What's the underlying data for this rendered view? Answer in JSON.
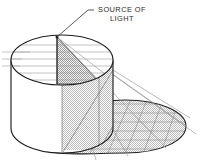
{
  "figure": {
    "label": {
      "line1": "SOURCE OF",
      "line2": "LIGHT",
      "full_text": "SOURCE OF LIGHT",
      "leader_line": "leader-line-to-source-point"
    },
    "colors": {
      "background": "#ffffff",
      "outline": "#1f1f1f",
      "construction_line": "#9a9a9a",
      "ray_line": "#8d8d8d",
      "stipple_fill": "#d9d9d9",
      "text": "#2b2b2b"
    },
    "parts": [
      {
        "name": "cylinder-top-ellipse",
        "description": "Top circular face of the cylinder seen in oblique projection"
      },
      {
        "name": "cylinder-body",
        "description": "Vertical side wall of the cylinder"
      },
      {
        "name": "cylinder-base-ellipse",
        "description": "Bottom circular face of the cylinder"
      },
      {
        "name": "light-source-point",
        "description": "Point source located above the top face"
      },
      {
        "name": "light-source-post",
        "description": "Vertical line dropping from the source to the top face"
      },
      {
        "name": "lit-top-sector",
        "description": "Stippled triangular sector of the top face reached by light"
      },
      {
        "name": "cylinder-shaded-side",
        "description": "Stippled portion of the cylinder wall in shade"
      },
      {
        "name": "cast-shadow",
        "description": "Stippled elliptical shadow projected onto the ground plane"
      },
      {
        "name": "light-rays",
        "description": "Straight rays radiating from the source past the cylinder edge"
      },
      {
        "name": "grid-lines",
        "description": "Horizontal construction lines used to project the shadow"
      }
    ],
    "counts": {
      "light_rays": 6,
      "horizontal_construction_lines": 6,
      "shadow_grid_rows": 6
    }
  }
}
